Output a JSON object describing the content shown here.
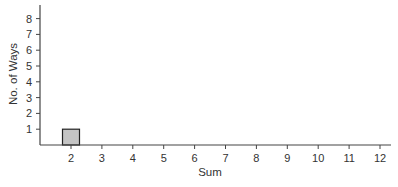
{
  "chart_data": {
    "type": "bar",
    "title": "",
    "xlabel": "Sum",
    "ylabel": "No. of Ways",
    "categories": [
      "2",
      "3",
      "4",
      "5",
      "6",
      "7",
      "8",
      "9",
      "10",
      "11",
      "12"
    ],
    "values": [
      1,
      0,
      0,
      0,
      0,
      0,
      0,
      0,
      0,
      0,
      0
    ],
    "yticks": [
      1,
      2,
      3,
      4,
      5,
      6,
      7,
      8
    ],
    "ylim": [
      0,
      8.8
    ],
    "grid": false,
    "legend": null,
    "bar_color": "#c4c4c4",
    "bar_edge_color": "#222222",
    "axis_color": "#444444"
  }
}
